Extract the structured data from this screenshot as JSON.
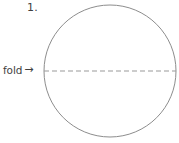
{
  "figure": {
    "canvas": {
      "width": 179,
      "height": 143,
      "background_color": "#ffffff"
    },
    "step_number": "1.",
    "fold_label": {
      "text": "fold",
      "arrow_glyph": "→",
      "icon_name": "right-arrow-icon"
    },
    "shapes": {
      "circle": {
        "center_x": 110,
        "center_y": 71,
        "radius": 66,
        "stroke_color": "#8d8d8d",
        "stroke_width": 1,
        "fill": "none"
      },
      "fold_line": {
        "x1": 44,
        "y1": 71,
        "x2": 176,
        "y2": 71,
        "stroke_color": "#9a9a9a",
        "stroke_width": 1.2,
        "dash_pattern": "5 3"
      }
    },
    "ink_color": "#3f3f3f"
  }
}
